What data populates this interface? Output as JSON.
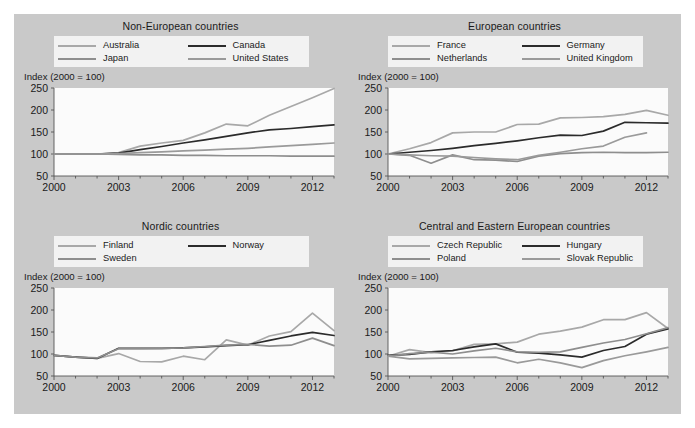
{
  "figure": {
    "background_color": "#c9c9c9",
    "plot_background_color": "#fbfbfb",
    "legend_background_color": "#f2f2f2"
  },
  "axis_note": "Index (2000 = 100)",
  "colors": {
    "light_gray": "#a8a8a8",
    "mid_gray": "#8e8e8e",
    "dark": "#2b2b2b",
    "pale_gray": "#bdbdbd"
  },
  "chart_data": [
    {
      "type": "line",
      "title": "Non-European countries",
      "xlabel": "",
      "ylabel": "Index (2000 = 100)",
      "ylim": [
        50,
        250
      ],
      "yticks": [
        50,
        100,
        150,
        200,
        250
      ],
      "xlim": [
        2000,
        2013
      ],
      "xticks": [
        2000,
        2003,
        2006,
        2009,
        2012
      ],
      "x": [
        2000,
        2001,
        2002,
        2003,
        2004,
        2005,
        2006,
        2007,
        2008,
        2009,
        2010,
        2011,
        2012,
        2013
      ],
      "grid": false,
      "legend_position": "top",
      "series": [
        {
          "name": "Australia",
          "color": "#a8a8a8",
          "values": [
            100,
            100,
            100,
            103,
            118,
            125,
            131,
            148,
            168,
            164,
            188,
            208,
            228,
            249
          ]
        },
        {
          "name": "Canada",
          "color": "#2b2b2b",
          "values": [
            100,
            100,
            100,
            102,
            110,
            117,
            125,
            132,
            140,
            148,
            155,
            158,
            162,
            166
          ]
        },
        {
          "name": "Japan",
          "color": "#8e8e8e",
          "values": [
            100,
            100,
            100,
            99,
            98,
            98,
            97,
            97,
            96,
            96,
            96,
            95,
            95,
            95
          ]
        },
        {
          "name": "United States",
          "color": "#9a9a9a",
          "values": [
            100,
            100,
            100,
            101,
            103,
            105,
            107,
            109,
            111,
            113,
            116,
            119,
            122,
            125
          ]
        }
      ]
    },
    {
      "type": "line",
      "title": "European countries",
      "xlabel": "",
      "ylabel": "Index (2000 = 100)",
      "ylim": [
        50,
        250
      ],
      "yticks": [
        50,
        100,
        150,
        200,
        250
      ],
      "xlim": [
        2000,
        2013
      ],
      "xticks": [
        2000,
        2003,
        2006,
        2009,
        2012
      ],
      "x": [
        2000,
        2001,
        2002,
        2003,
        2004,
        2005,
        2006,
        2007,
        2008,
        2009,
        2010,
        2011,
        2012,
        2013
      ],
      "grid": false,
      "legend_position": "top",
      "series": [
        {
          "name": "France",
          "color": "#a8a8a8",
          "values": [
            100,
            112,
            126,
            148,
            150,
            150,
            167,
            168,
            182,
            183,
            185,
            190,
            199,
            188
          ]
        },
        {
          "name": "Germany",
          "color": "#2b2b2b",
          "values": [
            100,
            104,
            108,
            113,
            119,
            124,
            130,
            137,
            143,
            142,
            152,
            172,
            171,
            170
          ]
        },
        {
          "name": "Netherlands",
          "color": "#8e8e8e",
          "values": [
            100,
            97,
            79,
            98,
            87,
            86,
            83,
            95,
            101,
            103,
            104,
            103,
            103,
            104
          ]
        },
        {
          "name": "United Kingdom",
          "color": "#9a9a9a",
          "values": [
            100,
            98,
            96,
            95,
            92,
            89,
            87,
            97,
            104,
            112,
            118,
            138,
            148,
            null
          ]
        }
      ]
    },
    {
      "type": "line",
      "title": "Nordic countries",
      "xlabel": "",
      "ylabel": "Index (2000 = 100)",
      "ylim": [
        50,
        250
      ],
      "yticks": [
        50,
        100,
        150,
        200,
        250
      ],
      "xlim": [
        2000,
        2013
      ],
      "xticks": [
        2000,
        2003,
        2006,
        2009,
        2012
      ],
      "x": [
        2000,
        2001,
        2002,
        2003,
        2004,
        2005,
        2006,
        2007,
        2008,
        2009,
        2010,
        2011,
        2012,
        2013
      ],
      "grid": false,
      "legend_position": "top",
      "series": [
        {
          "name": "Finland",
          "color": "#a8a8a8",
          "values": [
            97,
            93,
            90,
            101,
            83,
            82,
            95,
            87,
            132,
            120,
            141,
            151,
            193,
            153
          ]
        },
        {
          "name": "Norway",
          "color": "#2b2b2b",
          "values": [
            97,
            93,
            90,
            113,
            113,
            113,
            114,
            116,
            119,
            121,
            131,
            141,
            149,
            142
          ]
        },
        {
          "name": "Sweden",
          "color": "#8e8e8e",
          "values": [
            97,
            93,
            91,
            112,
            112,
            113,
            114,
            117,
            120,
            122,
            118,
            120,
            136,
            119
          ]
        }
      ]
    },
    {
      "type": "line",
      "title": "Central and Eastern European countries",
      "xlabel": "",
      "ylabel": "Index (2000 = 100)",
      "ylim": [
        50,
        250
      ],
      "yticks": [
        50,
        100,
        150,
        200,
        250
      ],
      "xlim": [
        2000,
        2013
      ],
      "xticks": [
        2000,
        2003,
        2006,
        2009,
        2012
      ],
      "x": [
        2000,
        2001,
        2002,
        2003,
        2004,
        2005,
        2006,
        2007,
        2008,
        2009,
        2010,
        2011,
        2012,
        2013
      ],
      "grid": false,
      "legend_position": "top",
      "series": [
        {
          "name": "Czech Republic",
          "color": "#a8a8a8",
          "values": [
            95,
            110,
            103,
            107,
            122,
            123,
            127,
            145,
            152,
            161,
            178,
            178,
            194,
            158
          ]
        },
        {
          "name": "Hungary",
          "color": "#2b2b2b",
          "values": [
            97,
            99,
            105,
            108,
            116,
            123,
            104,
            102,
            98,
            93,
            108,
            117,
            145,
            157
          ]
        },
        {
          "name": "Poland",
          "color": "#8e8e8e",
          "values": [
            95,
            101,
            104,
            100,
            107,
            113,
            105,
            104,
            105,
            115,
            125,
            133,
            146,
            160
          ]
        },
        {
          "name": "Slovak Republic",
          "color": "#9a9a9a",
          "values": [
            95,
            89,
            90,
            91,
            92,
            93,
            80,
            88,
            80,
            69,
            85,
            96,
            105,
            115
          ]
        }
      ]
    }
  ]
}
